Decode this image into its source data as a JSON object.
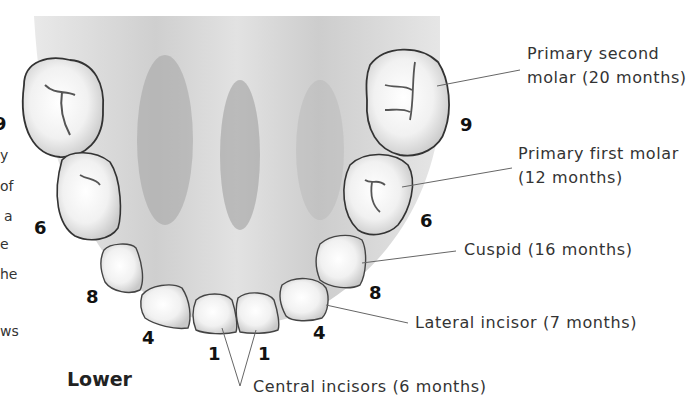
{
  "figure": {
    "jaw_label": "Lower",
    "teeth": [
      {
        "name": "primary-second-molar",
        "label_line1": "Primary second",
        "label_line2": "molar (20 months)",
        "number": "9"
      },
      {
        "name": "primary-first-molar",
        "label_line1": "Primary first molar",
        "label_line2": "(12 months)",
        "number": "6"
      },
      {
        "name": "cuspid",
        "label": "Cuspid (16 months)",
        "number": "8"
      },
      {
        "name": "lateral-incisor",
        "label": "Lateral incisor (7 months)",
        "number": "4"
      },
      {
        "name": "central-incisors",
        "label": "Central incisors (6 months)",
        "number": "1"
      }
    ],
    "left_numbers": {
      "molar2": "9",
      "molar1": "6",
      "cuspid": "8",
      "lateral": "4",
      "central": "1"
    },
    "right_numbers": {
      "molar2": "9",
      "molar1": "6",
      "cuspid": "8",
      "lateral": "4",
      "central": "1"
    }
  },
  "clipped_text_fragments": [
    "y",
    "of",
    "a",
    "e",
    "he",
    "ws"
  ]
}
